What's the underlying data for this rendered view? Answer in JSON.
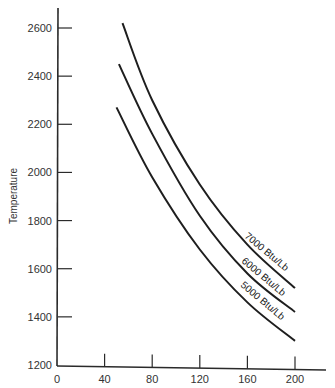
{
  "chart_data": {
    "type": "line",
    "title": "",
    "xlabel": "",
    "ylabel": "Temperature",
    "xlim": [
      0,
      220
    ],
    "ylim": [
      1200,
      2700
    ],
    "x_ticks": [
      0,
      40,
      80,
      120,
      160,
      200
    ],
    "y_ticks": [
      1200,
      1400,
      1600,
      1800,
      2000,
      2200,
      2400,
      2600
    ],
    "grid": false,
    "legend": "inline curve labels at right ends",
    "series": [
      {
        "name": "7000 Btu/Lb",
        "x": [
          55,
          80,
          120,
          160,
          200
        ],
        "y": [
          2620,
          2300,
          1950,
          1700,
          1520
        ]
      },
      {
        "name": "6000 Btu/Lb",
        "x": [
          52,
          80,
          120,
          160,
          200
        ],
        "y": [
          2450,
          2160,
          1820,
          1580,
          1420
        ]
      },
      {
        "name": "5000 Btu/Lb",
        "x": [
          50,
          80,
          120,
          160,
          200
        ],
        "y": [
          2270,
          1980,
          1680,
          1460,
          1300
        ]
      }
    ]
  },
  "labels": {
    "ylabel": "Temperature",
    "x_ticks": [
      "0",
      "40",
      "80",
      "120",
      "160",
      "200"
    ],
    "y_ticks": [
      "1200",
      "1400",
      "1600",
      "1800",
      "2000",
      "2200",
      "2400",
      "2600"
    ],
    "curves": [
      "7000 Btu/Lb",
      "6000 Btu/Lb",
      "5000 Btu/Lb"
    ]
  }
}
